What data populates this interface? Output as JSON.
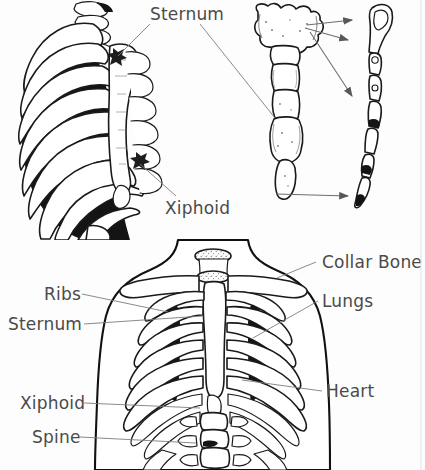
{
  "figure": {
    "background_color": "#fdfdfd",
    "ink_color": "#1a1a1a",
    "label_color": "#4a4a4a",
    "leader_color": "#7d7d7d"
  },
  "panels": {
    "top_left": {
      "name": "rib-cage-oblique-view"
    },
    "top_middle": {
      "name": "sternum-anterior-view"
    },
    "top_right": {
      "name": "sternum-lateral-view"
    },
    "bottom": {
      "name": "torso-anterior-skeleton-view"
    }
  },
  "labels": {
    "sternum_top": "Sternum",
    "xiphoid_top": "Xiphoid",
    "collar_bone": "Collar Bone",
    "ribs": "Ribs",
    "lungs": "Lungs",
    "sternum_bottom": "Sternum",
    "heart": "Heart",
    "xiphoid_bottom": "Xiphoid",
    "spine": "Spine"
  }
}
